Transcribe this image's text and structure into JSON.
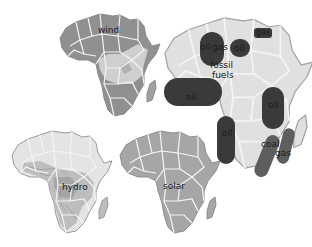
{
  "figure": {
    "colors": {
      "background": "#ffffff",
      "land_light": "#e2e2e2",
      "land_medium": "#a8a8a8",
      "land_dark": "#8f8f8f",
      "border": "#f4f4f4",
      "outline": "#9a9a9a",
      "deposit_dark": "#3a3a3a",
      "deposit_medium": "#5e5e5e",
      "text": "#1a1a1a"
    },
    "maps": [
      {
        "id": "wind",
        "label": "wind"
      },
      {
        "id": "hydro",
        "label": "hydro"
      },
      {
        "id": "solar",
        "label": "solar"
      },
      {
        "id": "fossil",
        "label_line1": "fossil",
        "label_line2": "fuels",
        "deposits": [
          {
            "type": "oil",
            "label": "oil"
          },
          {
            "type": "gas",
            "label": "gas"
          },
          {
            "type": "oil",
            "label": "oil"
          },
          {
            "type": "gas",
            "label": "gas"
          },
          {
            "type": "oil",
            "label": "oil"
          },
          {
            "type": "oil",
            "label": "oil"
          },
          {
            "type": "oil",
            "label": "oil"
          },
          {
            "type": "coal",
            "label": "coal"
          },
          {
            "type": "gas",
            "label": "gas"
          }
        ]
      }
    ]
  }
}
